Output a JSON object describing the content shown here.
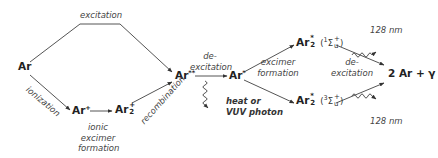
{
  "diagram": {
    "colors": {
      "line": "#555555",
      "text": "#222222",
      "italic": "#444444"
    },
    "species": {
      "ar": {
        "base": "Ar"
      },
      "ar_ion": {
        "base": "Ar",
        "sup": "+"
      },
      "ar2_ion": {
        "base": "Ar",
        "sup": "+",
        "sub": "2"
      },
      "ar_double_star": {
        "base": "Ar",
        "sup": "**"
      },
      "ar_star": {
        "base": "Ar",
        "sup": "*"
      },
      "ar2_star_singlet": {
        "base": "Ar",
        "sup": "*",
        "sub": "2",
        "term": "(¹Σᵤ⁺)",
        "term_mult": "1",
        "term_sym": "Σ",
        "term_sup": "+",
        "term_sub": "u"
      },
      "ar2_star_triplet": {
        "base": "Ar",
        "sup": "*",
        "sub": "2",
        "term": "(³Σᵤ⁺)",
        "term_mult": "3",
        "term_sym": "Σ",
        "term_sup": "+",
        "term_sub": "u"
      },
      "products": "2 Ar + γ"
    },
    "process_labels": {
      "excitation": "excitation",
      "ionization": "ionization",
      "ionic_excimer_formation": [
        "ionic",
        "excimer",
        "formation"
      ],
      "recombination": "recombination",
      "de_excitation_1": [
        "de-",
        "excitation"
      ],
      "heat_or_vuv": [
        "heat or",
        "VUV photon"
      ],
      "excimer_formation": [
        "excimer",
        "formation"
      ],
      "de_excitation_2": [
        "de-",
        "excitation"
      ]
    },
    "emissions": {
      "top": "128 nm",
      "bottom": "128 nm"
    }
  }
}
